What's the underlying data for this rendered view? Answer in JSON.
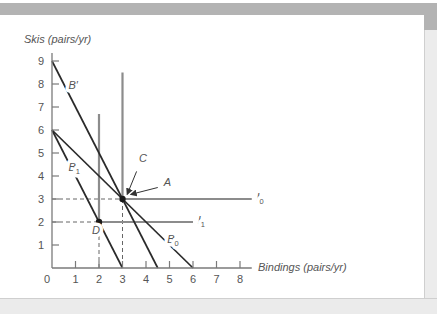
{
  "figure": {
    "colors": {
      "budget_line": "#2a2a2a",
      "indifference_curve": "#8c8c8c",
      "axis": "#7a7a7a",
      "guide_dashed": "#666666",
      "point": "#1a1a1a",
      "text": "#555555"
    }
  },
  "chart_data": {
    "type": "line",
    "title": "",
    "xlabel": "Bindings (pairs/yr)",
    "ylabel": "Skis (pairs/yr)",
    "xlim": [
      0,
      8
    ],
    "ylim": [
      0,
      9
    ],
    "grid": false,
    "x_ticks": [
      0,
      1,
      2,
      3,
      4,
      5,
      6,
      7,
      8
    ],
    "y_ticks": [
      1,
      2,
      3,
      4,
      5,
      6,
      7,
      8,
      9
    ],
    "budget_lines": [
      {
        "name": "B'",
        "base": "B",
        "sub": "",
        "prime": "′",
        "points": [
          [
            0,
            9
          ],
          [
            4.5,
            0
          ]
        ],
        "label_pos": [
          0.7,
          7.8
        ]
      },
      {
        "name": "B0",
        "base": "B",
        "sub": "0",
        "prime": "",
        "points": [
          [
            0,
            6
          ],
          [
            6,
            0
          ]
        ],
        "label_pos": [
          4.9,
          1.1
        ]
      },
      {
        "name": "B1",
        "base": "B",
        "sub": "1",
        "prime": "",
        "points": [
          [
            0,
            6
          ],
          [
            3,
            0
          ]
        ],
        "label_pos": [
          0.7,
          4.2
        ]
      }
    ],
    "indifference_curves": [
      {
        "name": "I0",
        "base": "I",
        "sub": "0",
        "corner": [
          3,
          3
        ],
        "vertical_top": 8.5,
        "horizontal_end": 8.5,
        "label_pos": [
          8.7,
          2.9
        ]
      },
      {
        "name": "I1",
        "base": "I",
        "sub": "1",
        "corner": [
          2,
          2
        ],
        "vertical_top": 6.7,
        "horizontal_end": 6.0,
        "label_pos": [
          6.2,
          1.9
        ]
      }
    ],
    "points": [
      {
        "name": "A/C",
        "x": 3,
        "y": 3
      },
      {
        "name": "D",
        "x": 2,
        "y": 2
      }
    ],
    "dashed_guides": [
      {
        "from": [
          0,
          3
        ],
        "to": [
          3,
          3
        ]
      },
      {
        "from": [
          3,
          3
        ],
        "to": [
          3,
          0
        ]
      },
      {
        "from": [
          0,
          2
        ],
        "to": [
          2,
          2
        ]
      },
      {
        "from": [
          2,
          2
        ],
        "to": [
          2,
          0
        ]
      }
    ],
    "annotations": [
      {
        "text": "C",
        "label_pos": [
          3.7,
          4.6
        ],
        "arrow_from": [
          3.6,
          4.2
        ],
        "arrow_to": [
          3.2,
          3.2
        ]
      },
      {
        "text": "A",
        "label_pos": [
          4.75,
          3.55
        ],
        "arrow_from": [
          4.5,
          3.5
        ],
        "arrow_to": [
          3.35,
          3.2
        ]
      },
      {
        "text": "D",
        "label_pos": [
          1.7,
          1.5
        ]
      }
    ]
  }
}
